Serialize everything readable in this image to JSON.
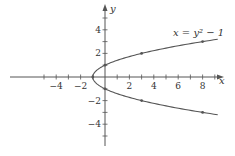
{
  "chart_data": {
    "type": "line",
    "title": "",
    "equation_label": "x = y² − 1",
    "xlabel": "x",
    "ylabel": "y",
    "xlim": [
      -7.8,
      9.8
    ],
    "ylim": [
      -5.6,
      6.0
    ],
    "x_ticks": [
      -4,
      -2,
      2,
      4,
      6,
      8
    ],
    "y_ticks": [
      4,
      2,
      -2,
      -4
    ],
    "x_minor_ticks": [
      -5,
      -4,
      -3,
      -2,
      -1,
      1,
      2,
      3,
      4,
      5,
      6,
      7,
      8,
      9
    ],
    "y_minor_ticks": [
      -5,
      -4,
      -3,
      -2,
      -1,
      1,
      2,
      3,
      4,
      5
    ],
    "grid": false,
    "series": [
      {
        "name": "x = y^2 - 1",
        "parametric": "x = y^2 - 1, y in [-3.2, 3.2]",
        "marked_points": [
          {
            "x": -1,
            "y": 0
          },
          {
            "x": 0,
            "y": 1
          },
          {
            "x": 0,
            "y": -1
          },
          {
            "x": 3,
            "y": 2
          },
          {
            "x": 3,
            "y": -2
          },
          {
            "x": 8,
            "y": 3
          },
          {
            "x": 8,
            "y": -3
          }
        ]
      }
    ]
  },
  "labels": {
    "x_axis": "x",
    "y_axis": "y",
    "equation": "x = y² − 1",
    "x_tick_labels": [
      "−4",
      "−2",
      "2",
      "4",
      "6",
      "8"
    ],
    "y_tick_labels": [
      "4",
      "2",
      "−2",
      "−4"
    ]
  }
}
